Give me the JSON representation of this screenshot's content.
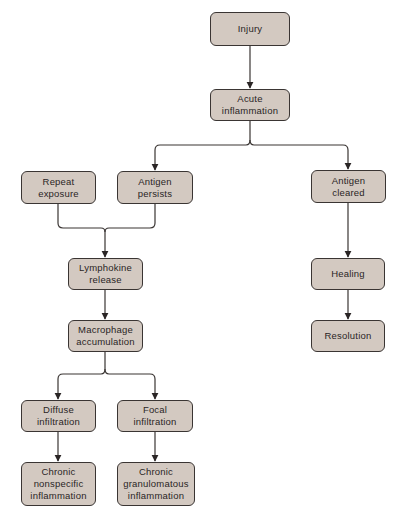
{
  "diagram": {
    "type": "flowchart",
    "colors": {
      "node_fill": "#d3c9c1",
      "node_border": "#3a3533",
      "line": "#3a3533",
      "text": "#2a2525"
    },
    "nodes": {
      "injury": {
        "label": "Injury"
      },
      "acute": {
        "label": "Acute\ninflammation"
      },
      "repeat": {
        "label": "Repeat\nexposure"
      },
      "persists": {
        "label": "Antigen\npersists"
      },
      "cleared": {
        "label": "Antigen\ncleared"
      },
      "lymphokine": {
        "label": "Lymphokine\nrelease"
      },
      "macrophage": {
        "label": "Macrophage\naccumulation"
      },
      "healing": {
        "label": "Healing"
      },
      "resolution": {
        "label": "Resolution"
      },
      "diffuse": {
        "label": "Diffuse\ninfiltration"
      },
      "focal": {
        "label": "Focal\ninfiltration"
      },
      "nonspecific": {
        "label": "Chronic\nnonspecific\ninflammation"
      },
      "granulomatous": {
        "label": "Chronic\ngranulomatous\ninflammation"
      }
    },
    "edges": [
      [
        "Injury",
        "Acute inflammation"
      ],
      [
        "Acute inflammation",
        "Antigen persists"
      ],
      [
        "Acute inflammation",
        "Antigen cleared"
      ],
      [
        "Repeat exposure",
        "Lymphokine release"
      ],
      [
        "Antigen persists",
        "Lymphokine release"
      ],
      [
        "Lymphokine release",
        "Macrophage accumulation"
      ],
      [
        "Macrophage accumulation",
        "Diffuse infiltration"
      ],
      [
        "Macrophage accumulation",
        "Focal infiltration"
      ],
      [
        "Diffuse infiltration",
        "Chronic nonspecific inflammation"
      ],
      [
        "Focal infiltration",
        "Chronic granulomatous inflammation"
      ],
      [
        "Antigen cleared",
        "Healing"
      ],
      [
        "Healing",
        "Resolution"
      ]
    ]
  }
}
